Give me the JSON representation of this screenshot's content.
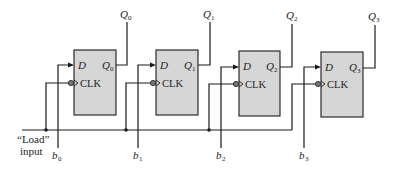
{
  "diagram": {
    "type": "parallel-load register (D flip-flops)",
    "load_label_line1": "“Load”",
    "load_label_line2": "input",
    "colors": {
      "box_fill": "#d6d6d6",
      "line": "#1a1a1a",
      "text": "#222222"
    },
    "flipflops": [
      {
        "id": "ff0",
        "d_label": "D",
        "clk_label": "CLK",
        "q_pin": "Q",
        "q_sub": "0",
        "out_label": "Q",
        "out_sub": "0",
        "in_label": "b",
        "in_sub": "0"
      },
      {
        "id": "ff1",
        "d_label": "D",
        "clk_label": "CLK",
        "q_pin": "Q",
        "q_sub": "1",
        "out_label": "Q",
        "out_sub": "1",
        "in_label": "b",
        "in_sub": "1"
      },
      {
        "id": "ff2",
        "d_label": "D",
        "clk_label": "CLK",
        "q_pin": "Q",
        "q_sub": "2",
        "out_label": "Q",
        "out_sub": "2",
        "in_label": "b",
        "in_sub": "2"
      },
      {
        "id": "ff3",
        "d_label": "D",
        "clk_label": "CLK",
        "q_pin": "Q",
        "q_sub": "3",
        "out_label": "Q",
        "out_sub": "3",
        "in_label": "b",
        "in_sub": "3"
      }
    ]
  }
}
